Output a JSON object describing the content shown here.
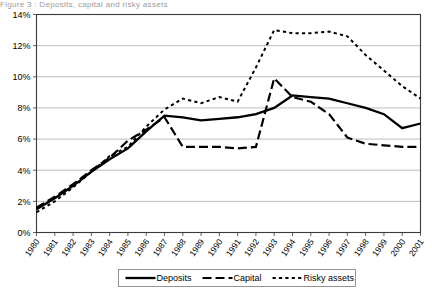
{
  "figure": {
    "clipped_title": "Figure 3 : Deposits, capital and risky assets"
  },
  "chart_data": {
    "type": "line",
    "title": "",
    "xlabel": "",
    "ylabel": "",
    "x": [
      1980,
      1981,
      1982,
      1983,
      1984,
      1985,
      1986,
      1987,
      1988,
      1989,
      1990,
      1991,
      1992,
      1993,
      1994,
      1995,
      1996,
      1997,
      1998,
      1999,
      2000,
      2001
    ],
    "xtick_labels": [
      "1980",
      "1981",
      "1982",
      "1983",
      "1984",
      "1985",
      "1986",
      "1987",
      "1988",
      "1989",
      "1990",
      "1991",
      "1992",
      "1993",
      "1994",
      "1995",
      "1996",
      "1997",
      "1998",
      "1999",
      "2000",
      "2001"
    ],
    "ytick_labels": [
      "0%",
      "2%",
      "4%",
      "6%",
      "8%",
      "10%",
      "12%",
      "14%"
    ],
    "ytick_values": [
      0,
      2,
      4,
      6,
      8,
      10,
      12,
      14
    ],
    "ylim": [
      0,
      14
    ],
    "xlim": [
      1980,
      2001
    ],
    "grid": true,
    "legend_position": "bottom",
    "series": [
      {
        "name": "Deposits",
        "style": "solid",
        "width": 2.3,
        "values": [
          1.5,
          2.2,
          3.0,
          3.9,
          4.7,
          5.4,
          6.5,
          7.5,
          7.4,
          7.2,
          7.3,
          7.4,
          7.6,
          8.0,
          8.8,
          8.7,
          8.6,
          8.3,
          8.0,
          7.6,
          6.7,
          7.0
        ]
      },
      {
        "name": "Capital",
        "style": "dashed",
        "width": 2.2,
        "values": [
          1.6,
          2.3,
          3.1,
          4.0,
          4.8,
          5.9,
          6.6,
          7.4,
          5.5,
          5.5,
          5.5,
          5.4,
          5.5,
          9.9,
          8.7,
          8.4,
          7.6,
          6.1,
          5.7,
          5.6,
          5.5,
          5.5
        ]
      },
      {
        "name": "Risky assets",
        "style": "dotted",
        "width": 2.0,
        "values": [
          1.3,
          2.0,
          2.9,
          3.9,
          4.9,
          5.5,
          6.8,
          7.9,
          8.6,
          8.3,
          8.7,
          8.4,
          10.6,
          13.0,
          12.8,
          12.8,
          12.9,
          12.6,
          11.4,
          10.4,
          9.4,
          8.6
        ]
      }
    ]
  },
  "legend": {
    "entries": [
      {
        "label": "Deposits"
      },
      {
        "label": "Capital"
      },
      {
        "label": "Risky assets"
      }
    ]
  }
}
